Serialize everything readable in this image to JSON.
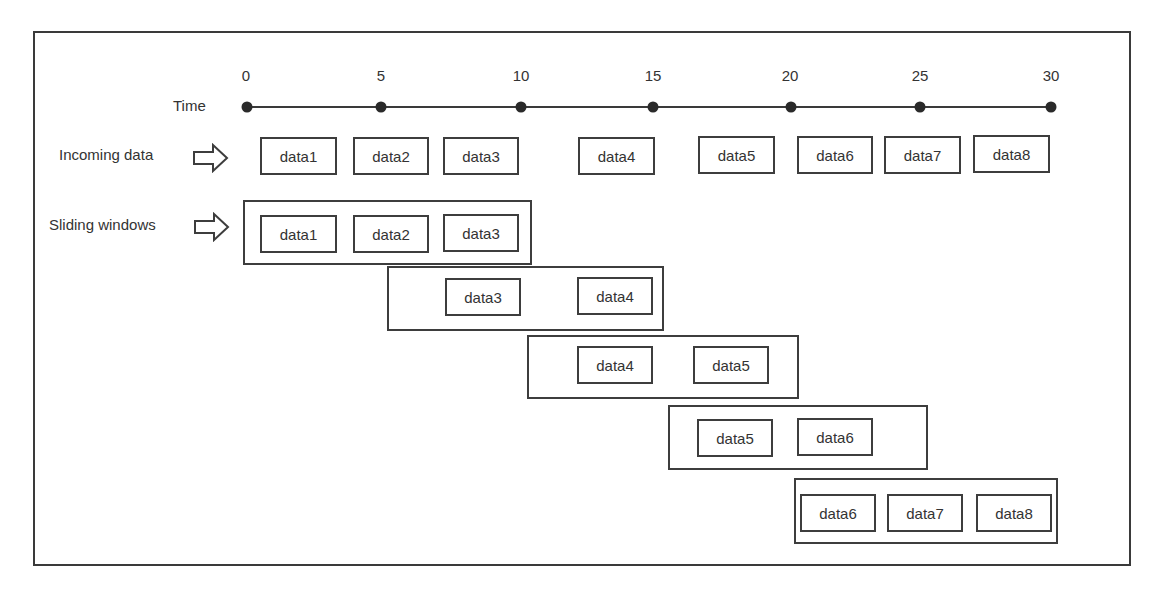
{
  "diagram": {
    "timeline": {
      "label": "Time",
      "ticks": [
        "0",
        "5",
        "10",
        "15",
        "20",
        "25",
        "30"
      ]
    },
    "incoming": {
      "label": "Incoming data",
      "arrow_icon": "hollow-right-arrow",
      "items": [
        "data1",
        "data2",
        "data3",
        "data4",
        "data5",
        "data6",
        "data7",
        "data8"
      ]
    },
    "sliding": {
      "label": "Sliding windows",
      "arrow_icon": "hollow-right-arrow",
      "windows": [
        {
          "items": [
            "data1",
            "data2",
            "data3"
          ]
        },
        {
          "items": [
            "data3",
            "data4"
          ]
        },
        {
          "items": [
            "data4",
            "data5"
          ]
        },
        {
          "items": [
            "data5",
            "data6"
          ]
        },
        {
          "items": [
            "data6",
            "data7",
            "data8"
          ]
        }
      ]
    },
    "colors": {
      "stroke": "#3d3d3d",
      "text": "#333333",
      "background": "#ffffff"
    }
  }
}
